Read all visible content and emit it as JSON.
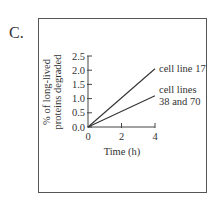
{
  "panel": {
    "label": "C."
  },
  "chart_data": {
    "type": "line",
    "title": "",
    "xlabel": "Time (h)",
    "ylabel": "% of long-lived proteins degraded",
    "ylabel_lines": [
      "% of long-lived",
      "proteins degraded"
    ],
    "x_ticks": [
      "0",
      "2",
      "4"
    ],
    "y_ticks": [
      "0.0",
      "0.5",
      "1.0",
      "1.5",
      "2.0",
      "2.5"
    ],
    "xlim": [
      0,
      4
    ],
    "ylim": [
      0,
      2.5
    ],
    "grid": false,
    "series": [
      {
        "name": "cell line 17",
        "label_lines": [
          "cell line 17"
        ],
        "x": [
          0,
          4
        ],
        "y": [
          0,
          2.05
        ]
      },
      {
        "name": "cell lines 38 and 70",
        "label_lines": [
          "cell lines",
          "38 and 70"
        ],
        "x": [
          0,
          4
        ],
        "y": [
          0,
          1.1
        ]
      }
    ]
  }
}
